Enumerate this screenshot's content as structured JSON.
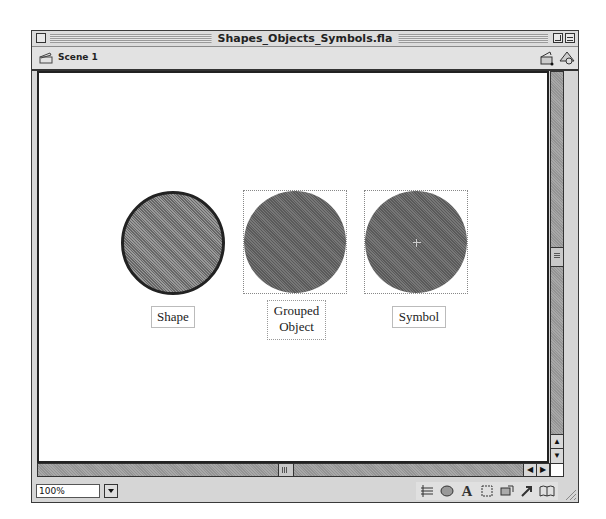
{
  "window": {
    "title": "Shapes_Objects_Symbols.fla"
  },
  "scenebar": {
    "scene_label": "Scene 1",
    "edit_scene_icon": "clapper-edit-icon",
    "edit_symbol_icon": "shapes-edit-icon"
  },
  "stage": {
    "objects": [
      {
        "type": "shape",
        "label": "Shape"
      },
      {
        "type": "grouped-object",
        "label_line1": "Grouped",
        "label_line2": "Object"
      },
      {
        "type": "symbol",
        "label": "Symbol"
      }
    ]
  },
  "statusbar": {
    "zoom_value": "100%",
    "tool_icons": [
      "align-icon",
      "color-mixer-icon",
      "character-icon",
      "instance-icon",
      "scene-icon",
      "actions-icon",
      "library-icon"
    ]
  },
  "colors": {
    "fill": "#666666",
    "window_bg": "#d6d6d6",
    "stage_bg": "#ffffff"
  }
}
